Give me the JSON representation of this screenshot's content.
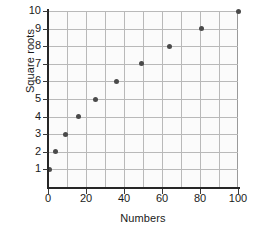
{
  "chart_data": {
    "type": "scatter",
    "title": "",
    "xlabel": "Numbers",
    "ylabel": "Square roots",
    "xlim": [
      0,
      100
    ],
    "ylim": [
      0,
      10
    ],
    "grid": true,
    "legend": "none",
    "x": [
      1,
      4,
      9,
      16,
      25,
      36,
      49,
      64,
      81,
      100
    ],
    "y": [
      1,
      2,
      3,
      4,
      5,
      6,
      7,
      8,
      9,
      10
    ],
    "points": [
      {
        "x": 1,
        "y": 1
      },
      {
        "x": 4,
        "y": 2
      },
      {
        "x": 9,
        "y": 3
      },
      {
        "x": 16,
        "y": 4
      },
      {
        "x": 25,
        "y": 5
      },
      {
        "x": 36,
        "y": 6
      },
      {
        "x": 49,
        "y": 7
      },
      {
        "x": 64,
        "y": 8
      },
      {
        "x": 81,
        "y": 9
      },
      {
        "x": 100,
        "y": 10
      }
    ],
    "xticks": [
      0,
      20,
      40,
      60,
      80,
      100
    ],
    "xtick_labels": [
      "0",
      "20",
      "40",
      "60",
      "80",
      "100"
    ],
    "x_minor_gridlines": [
      10,
      20,
      30,
      40,
      50,
      60,
      70,
      80,
      90
    ],
    "yticks": [
      1,
      2,
      3,
      4,
      5,
      6,
      7,
      8,
      9,
      10
    ],
    "ytick_labels": [
      "1",
      "2",
      "3",
      "4",
      "5",
      "6",
      "7",
      "8",
      "9",
      "10"
    ],
    "colors": {
      "marker": "#4a4a4a",
      "grid": "#b9b9b9",
      "axis": "#262626",
      "plot_background": "#fbfbfb",
      "figure_background": "#ffffff",
      "text": "#1a1a1a"
    }
  }
}
